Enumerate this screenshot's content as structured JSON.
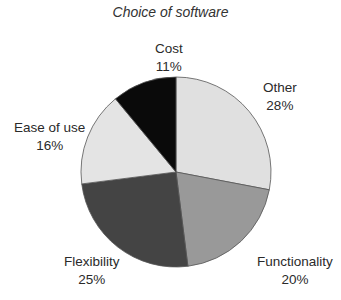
{
  "chart_data": {
    "type": "pie",
    "title": "Choice of software",
    "categories": [
      "Other",
      "Functionality",
      "Flexibility",
      "Ease of use",
      "Cost"
    ],
    "values": [
      28,
      20,
      25,
      16,
      11
    ],
    "value_labels": [
      "28%",
      "20%",
      "25%",
      "16%",
      "11%"
    ],
    "colors": [
      "#e0e0e0",
      "#999999",
      "#444444",
      "#e4e4e4",
      "#0a0a0a"
    ],
    "start_angle": "12 o'clock",
    "direction": "clockwise",
    "legend": "none (labels placed beside slices)"
  },
  "labels": {
    "other": {
      "name": "Other",
      "pct": "28%"
    },
    "functionality": {
      "name": "Functionality",
      "pct": "20%"
    },
    "flexibility": {
      "name": "Flexibility",
      "pct": "25%"
    },
    "ease": {
      "name": "Ease of use",
      "pct": "16%"
    },
    "cost": {
      "name": "Cost",
      "pct": "11%"
    }
  }
}
